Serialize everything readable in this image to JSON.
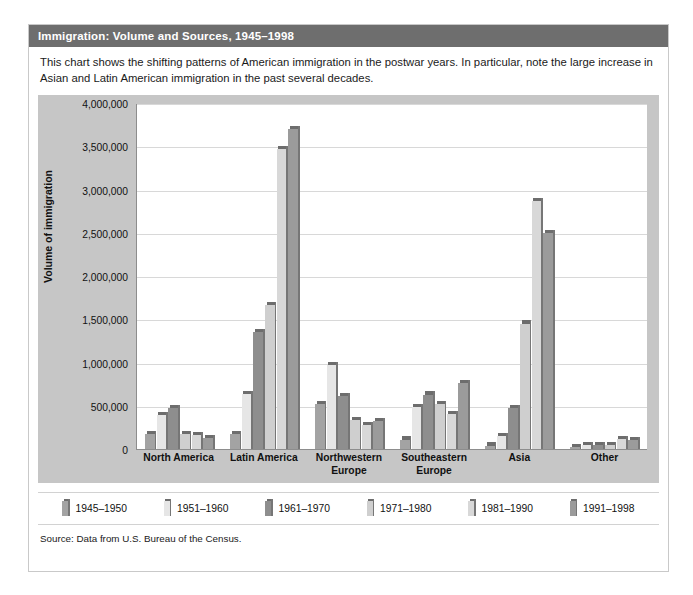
{
  "title": "Immigration: Volume and Sources, 1945–1998",
  "caption": "This chart shows the shifting patterns of American immigration in the postwar years. In particular, note the large increase in Asian and Latin American immigration in the past several decades.",
  "source": "Source: Data from U.S. Bureau of the Census.",
  "colors": {
    "title_bar": "#6e6e6e",
    "panel": "#c6c6c6",
    "plot": "#ffffff",
    "gridline": "#d8d8d8",
    "series": [
      "#a3a3a3",
      "#e6e6e6",
      "#8e8e8e",
      "#cfcfcf",
      "#d8d8d8",
      "#9b9b9b"
    ]
  },
  "chart_data": {
    "type": "bar",
    "title": "Immigration: Volume and Sources, 1945–1998",
    "xlabel": "",
    "ylabel": "Volume of immigration",
    "ylim": [
      0,
      4000000
    ],
    "yticks": [
      "0",
      "500,000",
      "1,000,000",
      "1,500,000",
      "2,000,000",
      "2,500,000",
      "3,000,000",
      "3,500,000",
      "4,000,000"
    ],
    "ytick_values": [
      0,
      500000,
      1000000,
      1500000,
      2000000,
      2500000,
      3000000,
      3500000,
      4000000
    ],
    "grid": true,
    "legend_position": "bottom",
    "categories": [
      "North America",
      "Latin America",
      "Northwestern Europe",
      "Southeastern Europe",
      "Asia",
      "Other"
    ],
    "series": [
      {
        "name": "1945–1950",
        "values": [
          170000,
          170000,
          520000,
          110000,
          40000,
          20000
        ]
      },
      {
        "name": "1951–1960",
        "values": [
          390000,
          640000,
          975000,
          480000,
          150000,
          50000
        ]
      },
      {
        "name": "1961–1970",
        "values": [
          470000,
          1350000,
          610000,
          630000,
          470000,
          50000
        ]
      },
      {
        "name": "1971–1980",
        "values": [
          170000,
          1660000,
          330000,
          520000,
          1450000,
          50000
        ]
      },
      {
        "name": "1981–1990",
        "values": [
          160000,
          3470000,
          280000,
          400000,
          2870000,
          120000
        ]
      },
      {
        "name": "1991–1998",
        "values": [
          130000,
          3700000,
          320000,
          760000,
          2500000,
          100000
        ]
      }
    ]
  }
}
